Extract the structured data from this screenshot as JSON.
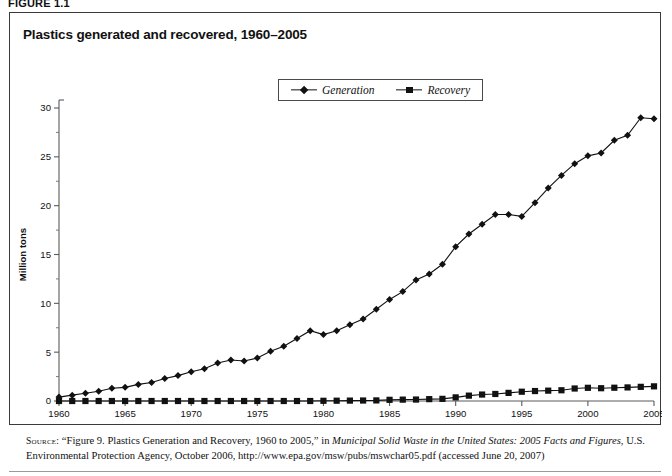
{
  "figure": {
    "label": "FIGURE 1.1"
  },
  "chart_box": {
    "title": "Plastics generated and recovered, 1960–2005"
  },
  "legend": {
    "position": "top-center",
    "entries": [
      {
        "label": "Generation",
        "marker": "diamond",
        "color": "#111111"
      },
      {
        "label": "Recovery",
        "marker": "square",
        "color": "#111111"
      }
    ]
  },
  "source": {
    "kicker": "Source:",
    "text_1": "“Figure 9. Plastics Generation and Recovery, 1960 to 2005,” in ",
    "italic_1": "Municipal Solid Waste in the United States: 2005 Facts and Figures",
    "text_2": ", U.S. Environmental Protection Agency, October 2006, http://www.epa.gov/msw/pubs/mswchar05.pdf (accessed June 20, 2007)"
  },
  "chart_data": {
    "type": "line",
    "title": "Plastics generated and recovered, 1960–2005",
    "xlabel": "Year",
    "ylabel": "Million tons",
    "xlim": [
      1960,
      2005
    ],
    "ylim": [
      0,
      30
    ],
    "xticks": [
      1960,
      1965,
      1970,
      1975,
      1980,
      1985,
      1990,
      1995,
      2000,
      2005
    ],
    "yticks": [
      0,
      5,
      10,
      15,
      20,
      25,
      30
    ],
    "yminorticks": [
      2.5,
      7.5,
      12.5,
      17.5,
      22.5,
      27.5
    ],
    "grid": false,
    "legend_position": "top-center",
    "x": [
      1960,
      1961,
      1962,
      1963,
      1964,
      1965,
      1966,
      1967,
      1968,
      1969,
      1970,
      1971,
      1972,
      1973,
      1974,
      1975,
      1976,
      1977,
      1978,
      1979,
      1980,
      1981,
      1982,
      1983,
      1984,
      1985,
      1986,
      1987,
      1988,
      1989,
      1990,
      1991,
      1992,
      1993,
      1994,
      1995,
      1996,
      1997,
      1998,
      1999,
      2000,
      2001,
      2002,
      2003,
      2004,
      2005
    ],
    "series": [
      {
        "name": "Generation",
        "marker": "diamond",
        "color": "#111111",
        "values": [
          0.4,
          0.6,
          0.8,
          1.0,
          1.3,
          1.4,
          1.7,
          1.9,
          2.3,
          2.6,
          3.0,
          3.3,
          3.9,
          4.2,
          4.1,
          4.4,
          5.1,
          5.6,
          6.4,
          7.2,
          6.8,
          7.2,
          7.8,
          8.4,
          9.4,
          10.4,
          11.2,
          12.4,
          13.0,
          14.0,
          15.8,
          17.1,
          18.1,
          19.1,
          19.1,
          18.9,
          20.3,
          21.8,
          23.1,
          24.3,
          25.1,
          25.4,
          26.7,
          27.2,
          29.0,
          28.9
        ]
      },
      {
        "name": "Recovery",
        "marker": "square",
        "color": "#111111",
        "values": [
          0.0,
          0.0,
          0.0,
          0.0,
          0.0,
          0.0,
          0.0,
          0.0,
          0.0,
          0.0,
          0.0,
          0.0,
          0.0,
          0.0,
          0.0,
          0.0,
          0.0,
          0.0,
          0.0,
          0.0,
          0.02,
          0.03,
          0.04,
          0.05,
          0.06,
          0.12,
          0.14,
          0.15,
          0.19,
          0.22,
          0.37,
          0.55,
          0.66,
          0.72,
          0.83,
          0.95,
          1.02,
          1.06,
          1.1,
          1.28,
          1.35,
          1.31,
          1.36,
          1.39,
          1.45,
          1.5
        ]
      }
    ]
  }
}
